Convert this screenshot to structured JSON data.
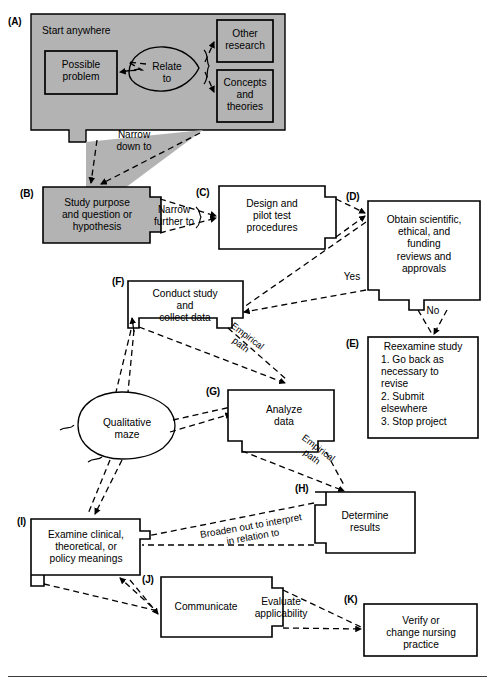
{
  "figure": {
    "type": "flowchart",
    "style": {
      "shaded_fill": "#b3b3b3",
      "plain_fill": "#ffffff",
      "stroke": "#000000",
      "dashed_edges": true
    }
  },
  "nodes": {
    "A": {
      "tag": "(A)",
      "header": "Start anywhere",
      "shaded": true,
      "children": {
        "possible_problem": "Possible\nproblem",
        "relate_to": "Relate\nto",
        "other_research": "Other\nresearch",
        "concepts_theories": "Concepts\nand\ntheories"
      }
    },
    "B": {
      "tag": "(B)",
      "label": "Study purpose\nand question or\nhypothesis",
      "shaded": true
    },
    "C": {
      "tag": "(C)",
      "label": "Design and\npilot test\nprocedures",
      "shaded": false
    },
    "D": {
      "tag": "(D)",
      "label": "Obtain scientific,\nethical, and\nfunding\nreviews and\napprovals",
      "shaded": false
    },
    "E": {
      "tag": "(E)",
      "title": "Reexamine study",
      "items": [
        "1. Go back as\n    necessary to\n    revise",
        "2. Submit\n    elsewhere",
        "3. Stop project"
      ],
      "shaded": false
    },
    "F": {
      "tag": "(F)",
      "label": "Conduct study\nand\ncollect data",
      "shaded": false
    },
    "G": {
      "tag": "(G)",
      "label": "Analyze\ndata",
      "shaded": false
    },
    "H": {
      "tag": "(H)",
      "label": "Determine\nresults",
      "shaded": false
    },
    "I": {
      "tag": "(I)",
      "label": "Examine clinical,\ntheoretical, or\npolicy meanings",
      "shaded": false
    },
    "J": {
      "tag": "(J)",
      "label_left": "Communicate",
      "label_right": "Evaluate\napplicability",
      "shaded": false
    },
    "K": {
      "tag": "(K)",
      "label": "Verify or\nchange nursing\npractice",
      "shaded": false
    },
    "maze": {
      "label": "Qualitative\nmaze",
      "shape": "oval"
    }
  },
  "edge_labels": {
    "narrow_down_to": "Narrow\ndown to",
    "narrow_further_to": "Narrow\nfurther to",
    "yes": "Yes",
    "no": "No",
    "empirical_path_1": "Empirical\npath",
    "empirical_path_2": "Empirical\npath",
    "broaden_out": "Broaden out to interpret\nin relation to"
  }
}
